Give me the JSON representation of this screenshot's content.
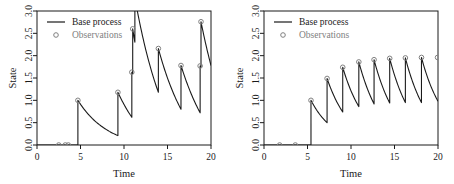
{
  "figure": {
    "panels": [
      {
        "name": "left-panel",
        "legend": {
          "line_label": "Base process",
          "point_label": "Observations"
        },
        "xlabel": "Time",
        "ylabel": "State",
        "xticks": [
          "0",
          "5",
          "10",
          "15",
          "20"
        ],
        "yticks": [
          "0.0",
          "0.5",
          "1.0",
          "1.5",
          "2.0",
          "2.5",
          "3.0"
        ]
      },
      {
        "name": "right-panel",
        "legend": {
          "line_label": "Base process",
          "point_label": "Observations"
        },
        "xlabel": "Time",
        "ylabel": "State",
        "xticks": [
          "0",
          "5",
          "10",
          "15",
          "20"
        ],
        "yticks": [
          "0.0",
          "0.5",
          "1.0",
          "1.5",
          "2.0",
          "2.5",
          "3.0"
        ]
      }
    ],
    "colors": {
      "line": "#1a1a1a",
      "marker_stroke": "#808080",
      "axis": "#1a1a1a",
      "legend_text_line": "#1a1a1a",
      "legend_text_point": "#808080",
      "background": "#ffffff"
    }
  },
  "chart_data": [
    {
      "type": "line",
      "name": "left-panel",
      "title": "",
      "xlabel": "Time",
      "ylabel": "State",
      "xlim": [
        0,
        20
      ],
      "ylim": [
        0,
        3
      ],
      "xticks": [
        0,
        5,
        10,
        15,
        20
      ],
      "yticks": [
        0.0,
        0.5,
        1.0,
        1.5,
        2.0,
        2.5,
        3.0
      ],
      "grid": false,
      "legend": [
        "Base process",
        "Observations"
      ],
      "legend_position": "top-left",
      "series": [
        {
          "name": "Base process",
          "style": "line",
          "comment": "Piecewise exponential-decay shot-noise path with upward jumps at event times",
          "jumps": [
            {
              "t": 4.7,
              "from": 0.0,
              "to": 1.0
            },
            {
              "t": 9.3,
              "from": 0.21,
              "to": 1.18
            },
            {
              "t": 10.9,
              "from": 0.62,
              "to": 1.63
            },
            {
              "t": 11.0,
              "from": 1.6,
              "to": 2.6
            },
            {
              "t": 11.25,
              "from": 2.3,
              "to": 3.3
            },
            {
              "t": 13.95,
              "from": 1.18,
              "to": 2.16
            },
            {
              "t": 16.55,
              "from": 0.8,
              "to": 1.78
            },
            {
              "t": 18.75,
              "from": 0.72,
              "to": 1.77
            },
            {
              "t": 18.85,
              "from": 1.75,
              "to": 2.76
            }
          ],
          "decay_rate": 0.3,
          "x": [
            0,
            4.7,
            4.7,
            9.3,
            9.3,
            10.9,
            10.9,
            11.0,
            11.0,
            11.25,
            11.25,
            13.95,
            13.95,
            16.55,
            16.55,
            18.75,
            18.75,
            18.85,
            18.85,
            20
          ],
          "y": [
            0,
            0,
            1.0,
            0.21,
            1.18,
            0.62,
            1.63,
            1.6,
            2.6,
            2.3,
            3.3,
            1.18,
            2.16,
            0.8,
            1.78,
            0.72,
            1.77,
            1.75,
            2.76,
            1.78
          ]
        },
        {
          "name": "Observations",
          "style": "points",
          "marker": "open-circle",
          "points": [
            {
              "t": 2.5,
              "state": 0.0
            },
            {
              "t": 3.25,
              "state": 0.0
            },
            {
              "t": 3.6,
              "state": 0.0
            },
            {
              "t": 4.7,
              "state": 1.0
            },
            {
              "t": 9.3,
              "state": 1.18
            },
            {
              "t": 10.9,
              "state": 1.63
            },
            {
              "t": 11.0,
              "state": 2.6
            },
            {
              "t": 13.95,
              "state": 2.16
            },
            {
              "t": 16.55,
              "state": 1.78
            },
            {
              "t": 18.75,
              "state": 1.77
            },
            {
              "t": 18.85,
              "state": 2.76
            }
          ]
        }
      ]
    },
    {
      "type": "line",
      "name": "right-panel",
      "title": "",
      "xlabel": "Time",
      "ylabel": "State",
      "xlim": [
        0,
        20
      ],
      "ylim": [
        0,
        3
      ],
      "xticks": [
        0,
        5,
        10,
        15,
        20
      ],
      "yticks": [
        0.0,
        0.5,
        1.0,
        1.5,
        2.0,
        2.5,
        3.0
      ],
      "grid": false,
      "legend": [
        "Base process",
        "Observations"
      ],
      "legend_position": "top-left",
      "series": [
        {
          "name": "Base process",
          "style": "line",
          "comment": "Regular sawtooth: unit jumps at near-evenly spaced times with exponential decay, peaks converge to about 1.95",
          "jumps": [
            {
              "t": 5.4,
              "from": 0.0,
              "to": 1.0
            },
            {
              "t": 7.25,
              "from": 0.5,
              "to": 1.49
            },
            {
              "t": 9.05,
              "from": 0.74,
              "to": 1.74
            },
            {
              "t": 10.9,
              "from": 0.86,
              "to": 1.86
            },
            {
              "t": 12.65,
              "from": 0.92,
              "to": 1.91
            },
            {
              "t": 14.45,
              "from": 0.94,
              "to": 1.94
            },
            {
              "t": 16.25,
              "from": 0.95,
              "to": 1.95
            },
            {
              "t": 18.1,
              "from": 0.95,
              "to": 1.96
            }
          ],
          "decay_rate": 0.38,
          "x": [
            0,
            5.4,
            5.4,
            7.25,
            7.25,
            9.05,
            9.05,
            10.9,
            10.9,
            12.65,
            12.65,
            14.45,
            14.45,
            16.25,
            16.25,
            18.1,
            18.1,
            20
          ],
          "y": [
            0,
            0,
            1.0,
            0.5,
            1.49,
            0.74,
            1.74,
            0.86,
            1.86,
            0.92,
            1.91,
            0.94,
            1.94,
            0.95,
            1.95,
            0.95,
            1.96,
            0.98
          ]
        },
        {
          "name": "Observations",
          "style": "points",
          "marker": "open-circle",
          "points": [
            {
              "t": 1.8,
              "state": 0.0
            },
            {
              "t": 3.6,
              "state": 0.0
            },
            {
              "t": 5.4,
              "state": 1.0
            },
            {
              "t": 7.25,
              "state": 1.49
            },
            {
              "t": 9.05,
              "state": 1.74
            },
            {
              "t": 10.9,
              "state": 1.86
            },
            {
              "t": 12.65,
              "state": 1.91
            },
            {
              "t": 14.45,
              "state": 1.94
            },
            {
              "t": 16.25,
              "state": 1.95
            },
            {
              "t": 18.1,
              "state": 1.96
            },
            {
              "t": 19.95,
              "state": 1.96
            }
          ]
        }
      ]
    }
  ]
}
